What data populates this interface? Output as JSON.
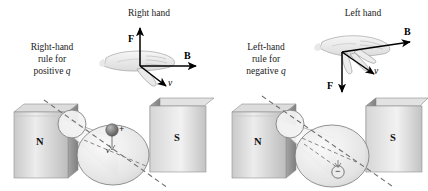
{
  "figure": {
    "background_color": "#ffffff",
    "ink_color": "#1a1a1a"
  },
  "panels": [
    {
      "id": "right-hand-panel",
      "hand_title": "Right hand",
      "rule_line1": "Right-hand",
      "rule_line2": "rule for",
      "rule_line3_prefix": "positive ",
      "rule_line3_symbol": "q",
      "vectors": [
        {
          "name": "force",
          "label": "F",
          "style": "bold",
          "direction": "up"
        },
        {
          "name": "magnetic",
          "label": "B",
          "style": "bold",
          "direction": "right"
        },
        {
          "name": "velocity",
          "label": "v",
          "style": "italic",
          "direction": "down-right"
        }
      ],
      "magnet_left_pole": "N",
      "magnet_right_pole": "S",
      "charge_sign": "+",
      "charge_fill": "#6f6f6f",
      "charge_position": "upper-center-of-large-circle",
      "velocity_tick_label": "v"
    },
    {
      "id": "left-hand-panel",
      "hand_title": "Left hand",
      "rule_line1": "Left-hand",
      "rule_line2": "rule for",
      "rule_line3_prefix": "negative ",
      "rule_line3_symbol": "q",
      "vectors": [
        {
          "name": "magnetic",
          "label": "B",
          "style": "bold",
          "direction": "up-right"
        },
        {
          "name": "velocity",
          "label": "v",
          "style": "italic",
          "direction": "down-right"
        },
        {
          "name": "force",
          "label": "F",
          "style": "bold",
          "direction": "down"
        }
      ],
      "magnet_left_pole": "N",
      "magnet_right_pole": "S",
      "charge_sign": "−",
      "charge_fill": "#e0e0e0",
      "charge_position": "lower-center-of-large-circle",
      "velocity_tick_label": ""
    }
  ],
  "colors": {
    "magnet_face_light": "#f0f0f0",
    "magnet_face_dark": "#9c9c9c",
    "magnet_side": "#8e8e8e",
    "magnet_top": "#d8d8d8",
    "cone_fill": "#eeeeee",
    "cone_stroke": "#8a8a8a",
    "dashed_line": "#7a7a7a",
    "hand_fill": "#efefef",
    "hand_stroke": "#9a9a9a",
    "arrow": "#000000"
  }
}
